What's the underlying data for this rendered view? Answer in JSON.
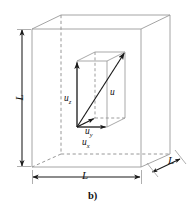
{
  "figure": {
    "caption": "b)",
    "dimension_labels": {
      "height": "L",
      "width": "L",
      "depth": "L"
    },
    "vectors": {
      "resultant": {
        "symbol": "u",
        "subscript": ""
      },
      "x_component": {
        "symbol": "u",
        "subscript": "x"
      },
      "y_component": {
        "symbol": "u",
        "subscript": "y"
      },
      "z_component": {
        "symbol": "u",
        "subscript": "z"
      }
    },
    "colors": {
      "cube_outline": "#9a9a9a",
      "hidden_edge": "#8c8c8c",
      "vector": "#1a1a1a",
      "dimension_arrow": "#1a1a1a",
      "text": "#111111",
      "background": "#ffffff"
    }
  }
}
